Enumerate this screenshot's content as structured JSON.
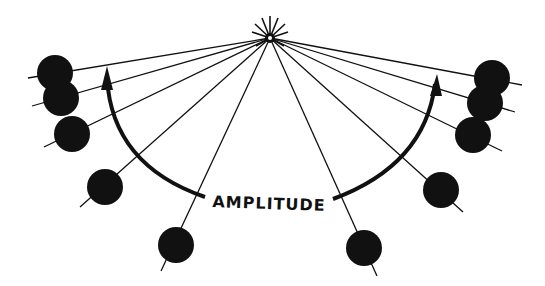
{
  "diagram": {
    "label": "AMPLITUDE",
    "colors": {
      "ink": "#111111",
      "background": "#ffffff"
    },
    "pivot": {
      "x": 270,
      "y": 38,
      "icon": "pivot-icon"
    },
    "left_bobs": [
      {
        "x": 55,
        "y": 73
      },
      {
        "x": 61,
        "y": 98
      },
      {
        "x": 72,
        "y": 134
      },
      {
        "x": 105,
        "y": 187
      },
      {
        "x": 176,
        "y": 245
      }
    ],
    "right_bobs": [
      {
        "x": 492,
        "y": 78
      },
      {
        "x": 485,
        "y": 103
      },
      {
        "x": 473,
        "y": 135
      },
      {
        "x": 441,
        "y": 190
      },
      {
        "x": 364,
        "y": 248
      }
    ],
    "arrows": {
      "left": "arc-arrow-left-icon",
      "right": "arc-arrow-right-icon"
    }
  }
}
